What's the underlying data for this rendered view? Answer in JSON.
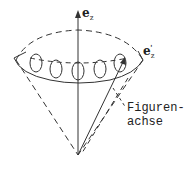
{
  "labels": {
    "ez": {
      "base": "e",
      "sub": "z"
    },
    "ez_prime": {
      "base": "e",
      "sub": "z",
      "prime": "'"
    },
    "figure_axis_line1": "Figuren-",
    "figure_axis_line2": "achse"
  },
  "colors": {
    "stroke": "#333333",
    "background": "#ffffff"
  }
}
